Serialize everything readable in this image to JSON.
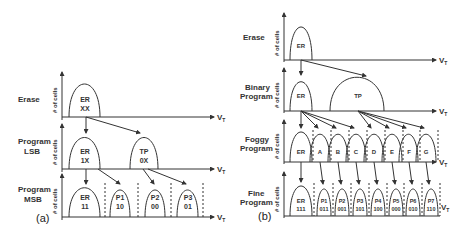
{
  "panel_a": {
    "label": "(a)",
    "rows": [
      {
        "name": "Erase",
        "states": [
          {
            "top": "ER",
            "bottom": "XX"
          }
        ]
      },
      {
        "name_line1": "Program",
        "name_line2": "LSB",
        "states": [
          {
            "top": "ER",
            "bottom": "1X"
          },
          {
            "top": "TP",
            "bottom": "0X"
          }
        ]
      },
      {
        "name_line1": "Program",
        "name_line2": "MSB",
        "states": [
          {
            "top": "ER",
            "bottom": "11"
          },
          {
            "top": "P1",
            "bottom": "10"
          },
          {
            "top": "P2",
            "bottom": "00"
          },
          {
            "top": "P3",
            "bottom": "01"
          }
        ]
      }
    ]
  },
  "panel_b": {
    "label": "(b)",
    "rows": [
      {
        "name": "Erase",
        "states": [
          {
            "top": "ER"
          }
        ]
      },
      {
        "name_line1": "Binary",
        "name_line2": "Program",
        "states": [
          {
            "top": "ER"
          },
          {
            "top": "TP"
          }
        ]
      },
      {
        "name_line1": "Foggy",
        "name_line2": "Program",
        "states": [
          {
            "top": "ER"
          },
          {
            "top": "A"
          },
          {
            "top": "B"
          },
          {
            "top": "C"
          },
          {
            "top": "D"
          },
          {
            "top": "E"
          },
          {
            "top": "F"
          },
          {
            "top": "G"
          }
        ]
      },
      {
        "name_line1": "Fine",
        "name_line2": "Program",
        "states": [
          {
            "top": "ER",
            "bottom": "111"
          },
          {
            "top": "P1",
            "bottom": "011"
          },
          {
            "top": "P2",
            "bottom": "001"
          },
          {
            "top": "P3",
            "bottom": "101"
          },
          {
            "top": "P4",
            "bottom": "100"
          },
          {
            "top": "P5",
            "bottom": "000"
          },
          {
            "top": "P6",
            "bottom": "010"
          },
          {
            "top": "P7",
            "bottom": "110"
          }
        ]
      }
    ]
  },
  "axis": {
    "y_label": "# of cells",
    "x_label": "V",
    "x_sub": "T"
  }
}
